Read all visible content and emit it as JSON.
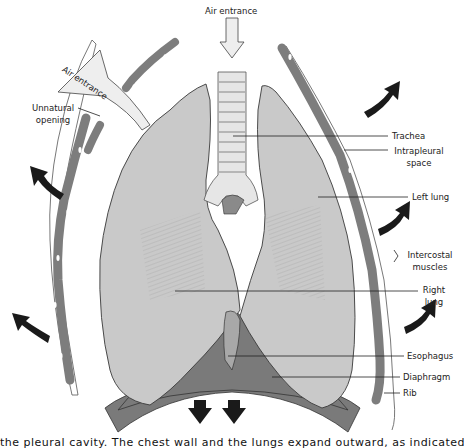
{
  "diagram": {
    "colors": {
      "lung": "#c9c9c9",
      "lung_outline": "#3a3a3a",
      "rib": "#7d7d7d",
      "diaphragm": "#7a7a7a",
      "trachea": "#e6e6e6",
      "arrow_dark": "#1a1a1a",
      "arrow_light": "#eeeeee"
    },
    "labels": {
      "air_entrance_top": "Air entrance",
      "air_entrance_side": "Air entrance",
      "unnatural_opening_1": "Unnatural",
      "unnatural_opening_2": "opening",
      "trachea": "Trachea",
      "intrapleural_1": "Intrapleural",
      "intrapleural_2": "space",
      "left_lung": "Left lung",
      "intercostal_1": "Intercostal",
      "intercostal_2": "muscles",
      "right_lung_1": "Right",
      "right_lung_2": "lung",
      "esophagus": "Esophagus",
      "diaphragm": "Diaphragm",
      "rib": "Rib"
    },
    "caption": "the pleural cavity. The chest wall and the lungs expand outward, as indicated by the arrows"
  }
}
